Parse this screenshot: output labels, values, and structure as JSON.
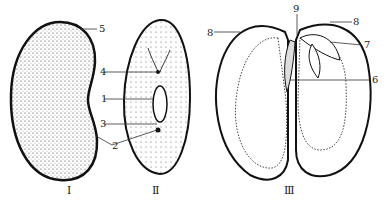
{
  "figure": {
    "panels": [
      {
        "id": "I",
        "caption": "Ⅰ"
      },
      {
        "id": "II",
        "caption": "Ⅱ"
      },
      {
        "id": "III",
        "caption": "Ⅲ"
      }
    ],
    "labels": {
      "l1": "1",
      "l2": "2",
      "l3": "3",
      "l4": "4",
      "l5": "5",
      "l6": "6",
      "l7": "7",
      "l8a": "8",
      "l8b": "8",
      "l9": "9"
    }
  }
}
